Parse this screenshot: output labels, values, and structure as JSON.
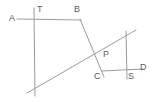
{
  "figure": {
    "type": "geometry-line-diagram",
    "background_color": "#ffffff",
    "stroke_color": "#9a9a9a",
    "label_color": "#5b5b5b",
    "width": 157,
    "height": 102,
    "labels": [
      {
        "id": "A",
        "text": "A",
        "x": 9,
        "y": 14
      },
      {
        "id": "T",
        "text": "T",
        "x": 37,
        "y": 5
      },
      {
        "id": "B",
        "text": "B",
        "x": 74,
        "y": 5
      },
      {
        "id": "P",
        "text": "P",
        "x": 103,
        "y": 50
      },
      {
        "id": "C",
        "text": "C",
        "x": 94,
        "y": 72
      },
      {
        "id": "S",
        "text": "S",
        "x": 128,
        "y": 72
      },
      {
        "id": "D",
        "text": "D",
        "x": 140,
        "y": 63
      }
    ],
    "segments": [
      {
        "id": "line-AB",
        "x1": 17,
        "y1": 19,
        "x2": 81,
        "y2": 20
      },
      {
        "id": "line-CD",
        "x1": 102,
        "y1": 71,
        "x2": 143,
        "y2": 69
      },
      {
        "id": "vertical-left-T",
        "x1": 34,
        "y1": 8,
        "x2": 35,
        "y2": 96
      },
      {
        "id": "vertical-right-S",
        "x1": 126,
        "y1": 31,
        "x2": 127,
        "y2": 79
      },
      {
        "id": "transversal-B-to-C",
        "x1": 80,
        "y1": 19,
        "x2": 104,
        "y2": 77
      },
      {
        "id": "transversal-rising",
        "x1": 27,
        "y1": 93,
        "x2": 136,
        "y2": 30
      }
    ]
  }
}
